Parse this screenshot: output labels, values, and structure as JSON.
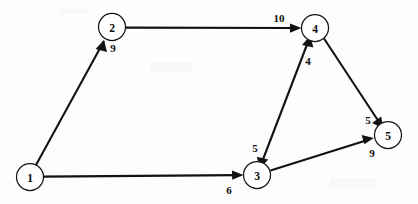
{
  "figure": {
    "type": "directed-weighted-graph",
    "background_color": "#fdfdfd",
    "stroke_color": "#121212",
    "node_fill_color": "#ffffff",
    "width": 418,
    "height": 204,
    "node_radius": 13.5
  },
  "nodes": [
    {
      "id": "1",
      "label": "1",
      "cx": 30,
      "cy": 177
    },
    {
      "id": "2",
      "label": "2",
      "cx": 112,
      "cy": 27
    },
    {
      "id": "3",
      "label": "3",
      "cx": 257,
      "cy": 175
    },
    {
      "id": "4",
      "label": "4",
      "cx": 315,
      "cy": 28
    },
    {
      "id": "5",
      "label": "5",
      "cx": 388,
      "cy": 135
    }
  ],
  "edges": [
    {
      "id": "e1",
      "from": "1",
      "to": "2",
      "weight": "9",
      "label_x": 113,
      "label_y": 48,
      "directed": true
    },
    {
      "id": "e2",
      "from": "1",
      "to": "3",
      "weight": "6",
      "label_x": 229,
      "label_y": 190,
      "directed": true
    },
    {
      "id": "e3",
      "from": "2",
      "to": "4",
      "weight": "10",
      "label_x": 279,
      "label_y": 18,
      "directed": true
    },
    {
      "id": "e4",
      "from": "3",
      "to": "4",
      "weight": "4",
      "label_x": 308,
      "label_y": 61,
      "directed": true
    },
    {
      "id": "e5",
      "from": "4",
      "to": "3",
      "weight": "5",
      "label_x": 255,
      "label_y": 148,
      "directed": true
    },
    {
      "id": "e6",
      "from": "4",
      "to": "5",
      "weight": "5",
      "label_x": 368,
      "label_y": 120,
      "directed": true
    },
    {
      "id": "e7",
      "from": "3",
      "to": "5",
      "weight": "9",
      "label_x": 372,
      "label_y": 153,
      "directed": true
    }
  ]
}
